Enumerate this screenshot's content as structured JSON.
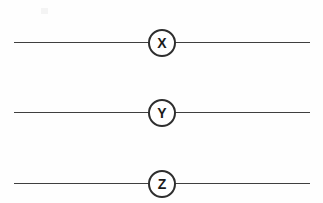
{
  "diagram": {
    "background_color": "#fefefe",
    "line_color": "#3f3f3f",
    "node_stroke_color": "#2e2e2e",
    "node_fill_color": "#ffffff",
    "label_color": "#1a1a1a",
    "rows": [
      {
        "id": "row-x",
        "label": "X",
        "line_y": 42,
        "line_x_start": 14,
        "line_x_end": 310,
        "node_center_x": 162
      },
      {
        "id": "row-y",
        "label": "Y",
        "line_y": 112,
        "line_x_start": 14,
        "line_x_end": 310,
        "node_center_x": 162
      },
      {
        "id": "row-z",
        "label": "Z",
        "line_y": 183,
        "line_x_start": 14,
        "line_x_end": 310,
        "node_center_x": 162
      }
    ]
  }
}
